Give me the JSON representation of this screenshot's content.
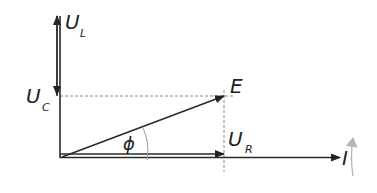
{
  "diagram": {
    "type": "phasor-diagram",
    "labels": {
      "ul_main": "U",
      "ul_sub": "L",
      "uc_main": "U",
      "uc_sub": "C",
      "e": "E",
      "ur_main": "U",
      "ur_sub": "R",
      "i": "I",
      "phi": "ϕ"
    },
    "vectors": [
      {
        "name": "U_L",
        "direction": "up"
      },
      {
        "name": "U_C",
        "direction": "down"
      },
      {
        "name": "E",
        "direction": "diagonal"
      },
      {
        "name": "U_R",
        "direction": "right"
      },
      {
        "name": "I",
        "direction": "right"
      }
    ],
    "rotation_indicator": "counter-clockwise",
    "colors": {
      "line": "#2a2a2a",
      "dashed": "#888888",
      "rotation_arrow": "#b0b0b0"
    }
  }
}
